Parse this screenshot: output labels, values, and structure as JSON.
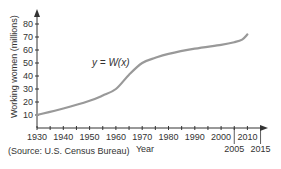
{
  "chart_data": {
    "type": "line",
    "title": "",
    "xlabel": "Year",
    "ylabel": "Working women (millions)",
    "function_label": "y = W(x)",
    "x_ticks": [
      1930,
      1940,
      1950,
      1960,
      1970,
      1980,
      1990,
      2000,
      2010
    ],
    "x_extra_ticks": [
      2005,
      2015
    ],
    "y_ticks": [
      10,
      20,
      30,
      40,
      50,
      60,
      70,
      80
    ],
    "xlim": [
      1930,
      2018
    ],
    "ylim": [
      0,
      85
    ],
    "grid": false,
    "series": [
      {
        "name": "W(x)",
        "x": [
          1930,
          1940,
          1950,
          1955,
          1960,
          1965,
          1970,
          1975,
          1980,
          1990,
          2000,
          2005,
          2008,
          2010
        ],
        "values": [
          10,
          15,
          21,
          25,
          30,
          41,
          50,
          54,
          57,
          61,
          64,
          66,
          68,
          72
        ]
      }
    ],
    "source": "(Source: U.S. Census Bureau)"
  }
}
